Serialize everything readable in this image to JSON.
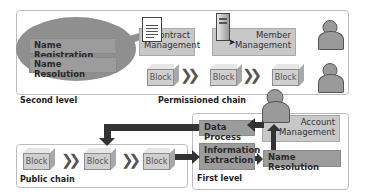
{
  "second_level": {
    "label": "Second level",
    "ellipse_items": [
      "Name Registration",
      "Name Resolution"
    ],
    "contract_management": "Contract Management",
    "member_management": "Member Management",
    "permissioned_chain": {
      "label": "Permissioned chain",
      "blocks": [
        "Block",
        "Block",
        "Block"
      ]
    }
  },
  "public_chain": {
    "label": "Public chain",
    "blocks": [
      "Block",
      "Block",
      "Block"
    ]
  },
  "first_level": {
    "label": "First level",
    "data_process": "Data Process",
    "account_management": "Account Management",
    "information_extraction": "Information Extraction",
    "name_resolution": "Name Resolution"
  },
  "icons": {
    "document": "document-icon",
    "server": "server-icon",
    "user": "user-icon"
  },
  "colors": {
    "box_light": "#c8c8c8",
    "box_dark": "#9c9c9c",
    "ellipse": "#8f8f8f",
    "arrow": "#333333"
  }
}
